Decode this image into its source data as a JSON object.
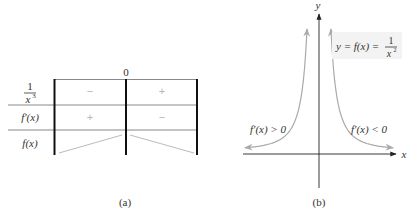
{
  "panel_a": {
    "caption": "(a)",
    "column_header": "0",
    "rows": [
      {
        "label_type": "fraction",
        "numerator": "1",
        "denominator": "x",
        "exponent": "3",
        "signs": [
          "−",
          "+"
        ]
      },
      {
        "label": "f′(x)",
        "signs": [
          "+",
          "−"
        ]
      },
      {
        "label": "f(x)",
        "trend": [
          "increasing",
          "decreasing"
        ]
      }
    ]
  },
  "panel_b": {
    "caption": "(b)",
    "x_axis_label": "x",
    "y_axis_label": "y",
    "function_label": {
      "lhs": "y = f(x) =",
      "numerator": "1",
      "denominator": "x",
      "exponent": "2"
    },
    "left_annotation": "f′(x) > 0",
    "right_annotation": "f′(x) < 0"
  },
  "colors": {
    "axis": "#222222",
    "curve": "#aaaaaa",
    "grid_line": "#888888",
    "label_box": "#f3f3f3"
  }
}
